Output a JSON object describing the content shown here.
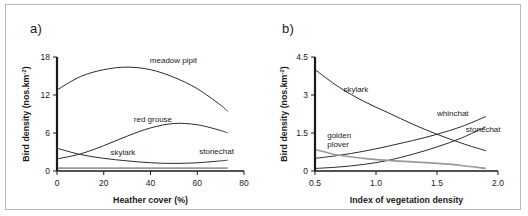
{
  "figure": {
    "panel_a_letter": "a)",
    "panel_b_letter": "b)"
  },
  "chart_data": [
    {
      "type": "line",
      "panel": "a)",
      "title": "",
      "xlabel": "Heather cover (%)",
      "ylabel": "Bird density (nos.km-2)",
      "ylabel_base": "Bird density (nos.km",
      "ylabel_sup": "-2",
      "ylabel_tail": ")",
      "xlim": [
        0,
        80
      ],
      "ylim": [
        0,
        18
      ],
      "xticks": [
        0,
        20,
        40,
        60,
        80
      ],
      "xtick_labels": [
        "0",
        "20",
        "40",
        "60",
        "80"
      ],
      "yticks": [
        0,
        6,
        12,
        18
      ],
      "ytick_labels": [
        "0",
        "6",
        "12",
        "18"
      ],
      "grid": false,
      "legend_position": "inline-annotations",
      "series": [
        {
          "name": "meadow pipit",
          "label": "meadow pipit",
          "x": [
            0,
            10,
            20,
            30,
            40,
            50,
            60,
            70,
            73
          ],
          "values": [
            12.8,
            14.9,
            16.0,
            16.4,
            16.0,
            14.8,
            13.0,
            10.4,
            9.4
          ]
        },
        {
          "name": "red grouse",
          "label": "red grouse",
          "x": [
            0,
            10,
            20,
            30,
            40,
            50,
            60,
            70,
            73
          ],
          "values": [
            1.9,
            2.7,
            4.0,
            5.5,
            6.8,
            7.5,
            7.3,
            6.4,
            6.0
          ]
        },
        {
          "name": "skylark",
          "label": "skylark",
          "x": [
            0,
            10,
            20,
            30,
            40,
            50,
            60,
            70,
            73
          ],
          "values": [
            3.6,
            2.6,
            2.0,
            1.6,
            1.3,
            1.2,
            1.3,
            1.6,
            1.7
          ]
        },
        {
          "name": "stonechat",
          "label": "stonechat",
          "x": [
            0,
            20,
            40,
            60,
            73
          ],
          "values": [
            0.45,
            0.45,
            0.45,
            0.45,
            0.45
          ]
        }
      ]
    },
    {
      "type": "line",
      "panel": "b)",
      "title": "",
      "xlabel": "Index of vegetation density",
      "ylabel": "Bird density (nos.km-2)",
      "ylabel_base": "Bird density (nos.km",
      "ylabel_sup": "-2",
      "ylabel_tail": ")",
      "xlim": [
        0.5,
        2.0
      ],
      "ylim": [
        0,
        4.5
      ],
      "xticks": [
        0.5,
        1.0,
        1.5,
        2.0
      ],
      "xtick_labels": [
        "0.5",
        "1.0",
        "1.5",
        "2.0"
      ],
      "yticks": [
        0,
        1.5,
        3,
        4.5
      ],
      "ytick_labels": [
        "0",
        "1.5",
        "3",
        "4.5"
      ],
      "grid": false,
      "legend_position": "inline-annotations",
      "series": [
        {
          "name": "skylark",
          "label": "skylark",
          "x": [
            0.5,
            0.7,
            0.9,
            1.1,
            1.3,
            1.5,
            1.7,
            1.9
          ],
          "values": [
            4.0,
            3.3,
            2.75,
            2.3,
            1.85,
            1.45,
            1.1,
            0.8
          ]
        },
        {
          "name": "whinchat",
          "label": "whinchat",
          "x": [
            0.5,
            0.7,
            0.9,
            1.1,
            1.3,
            1.5,
            1.7,
            1.9
          ],
          "values": [
            0.5,
            0.62,
            0.78,
            0.98,
            1.2,
            1.45,
            1.75,
            2.15
          ]
        },
        {
          "name": "stonechat",
          "label": "stonechat",
          "x": [
            0.5,
            0.7,
            0.9,
            1.1,
            1.3,
            1.5,
            1.7,
            1.9
          ],
          "values": [
            0.1,
            0.16,
            0.26,
            0.42,
            0.66,
            0.95,
            1.3,
            1.75
          ]
        },
        {
          "name": "golden plover",
          "label": "golden plover",
          "label_line1": "golden",
          "label_line2": "plover",
          "x": [
            0.5,
            0.7,
            0.9,
            1.1,
            1.3,
            1.5,
            1.7,
            1.9
          ],
          "values": [
            0.85,
            0.62,
            0.5,
            0.42,
            0.36,
            0.3,
            0.22,
            0.1
          ]
        }
      ]
    }
  ]
}
